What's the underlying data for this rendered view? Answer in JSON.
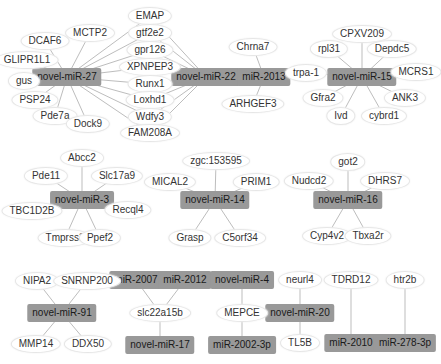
{
  "colors": {
    "mirna_fill": "#999999",
    "gene_fill": "#ffffff",
    "edge": "#bdbdbd",
    "text": "#333333"
  },
  "nodes": [
    {
      "id": "novel-miR-27",
      "type": "mirna",
      "x": 67,
      "y": 77
    },
    {
      "id": "novel-miR-22",
      "type": "mirna",
      "x": 206,
      "y": 77
    },
    {
      "id": "miR-2013",
      "type": "mirna",
      "x": 264,
      "y": 77
    },
    {
      "id": "novel-miR-15",
      "type": "mirna",
      "x": 362,
      "y": 77
    },
    {
      "id": "novel-miR-3",
      "type": "mirna",
      "x": 82,
      "y": 200
    },
    {
      "id": "novel-miR-14",
      "type": "mirna",
      "x": 215,
      "y": 200
    },
    {
      "id": "novel-miR-16",
      "type": "mirna",
      "x": 348,
      "y": 200
    },
    {
      "id": "novel-miR-91",
      "type": "mirna",
      "x": 62,
      "y": 313
    },
    {
      "id": "miR-2007",
      "type": "mirna",
      "x": 136,
      "y": 280
    },
    {
      "id": "miR-2012",
      "type": "mirna",
      "x": 185,
      "y": 280
    },
    {
      "id": "novel-miR-17",
      "type": "mirna",
      "x": 160,
      "y": 345
    },
    {
      "id": "novel-miR-4",
      "type": "mirna",
      "x": 242,
      "y": 280
    },
    {
      "id": "miR-2002-3p",
      "type": "mirna",
      "x": 242,
      "y": 345
    },
    {
      "id": "novel-miR-20",
      "type": "mirna",
      "x": 300,
      "y": 313
    },
    {
      "id": "miR-2010",
      "type": "mirna",
      "x": 351,
      "y": 343
    },
    {
      "id": "miR-278-3p",
      "type": "mirna",
      "x": 405,
      "y": 343
    },
    {
      "id": "EMAP",
      "type": "gene",
      "x": 150,
      "y": 16
    },
    {
      "id": "gtf2e2",
      "type": "gene",
      "x": 150,
      "y": 33
    },
    {
      "id": "gpr126",
      "type": "gene",
      "x": 150,
      "y": 50
    },
    {
      "id": "XPNPEP3",
      "type": "gene",
      "x": 150,
      "y": 67
    },
    {
      "id": "Runx1",
      "type": "gene",
      "x": 150,
      "y": 84
    },
    {
      "id": "Loxhd1",
      "type": "gene",
      "x": 150,
      "y": 100
    },
    {
      "id": "Wdfy3",
      "type": "gene",
      "x": 150,
      "y": 117
    },
    {
      "id": "FAM208A",
      "type": "gene",
      "x": 150,
      "y": 133
    },
    {
      "id": "MCTP2",
      "type": "gene",
      "x": 90,
      "y": 33
    },
    {
      "id": "DCAF6",
      "type": "gene",
      "x": 45,
      "y": 41
    },
    {
      "id": "GLIPR1L1",
      "type": "gene",
      "x": 27,
      "y": 60
    },
    {
      "id": "gus",
      "type": "gene",
      "x": 24,
      "y": 81
    },
    {
      "id": "PSP24",
      "type": "gene",
      "x": 35,
      "y": 100
    },
    {
      "id": "Pde7a",
      "type": "gene",
      "x": 55,
      "y": 116
    },
    {
      "id": "Dock9",
      "type": "gene",
      "x": 88,
      "y": 124
    },
    {
      "id": "Chrna7",
      "type": "gene",
      "x": 253,
      "y": 47
    },
    {
      "id": "ARHGEF3",
      "type": "gene",
      "x": 253,
      "y": 104
    },
    {
      "id": "CPXV209",
      "type": "gene",
      "x": 362,
      "y": 34
    },
    {
      "id": "rpl31",
      "type": "gene",
      "x": 329,
      "y": 49
    },
    {
      "id": "Depdc5",
      "type": "gene",
      "x": 392,
      "y": 49
    },
    {
      "id": "trpa-1",
      "type": "gene",
      "x": 306,
      "y": 73
    },
    {
      "id": "MCRS1",
      "type": "gene",
      "x": 416,
      "y": 72
    },
    {
      "id": "Gfra2",
      "type": "gene",
      "x": 323,
      "y": 98
    },
    {
      "id": "ANK3",
      "type": "gene",
      "x": 405,
      "y": 98
    },
    {
      "id": "Ivd",
      "type": "gene",
      "x": 341,
      "y": 116
    },
    {
      "id": "cybrd1",
      "type": "gene",
      "x": 384,
      "y": 116
    },
    {
      "id": "Abcc2",
      "type": "gene",
      "x": 82,
      "y": 158
    },
    {
      "id": "Pde11",
      "type": "gene",
      "x": 46,
      "y": 176
    },
    {
      "id": "Slc17a9",
      "type": "gene",
      "x": 117,
      "y": 176
    },
    {
      "id": "TBC1D2B",
      "type": "gene",
      "x": 32,
      "y": 211
    },
    {
      "id": "Recql4",
      "type": "gene",
      "x": 128,
      "y": 210
    },
    {
      "id": "Tmprss3",
      "type": "gene",
      "x": 65,
      "y": 238
    },
    {
      "id": "Ppef2",
      "type": "gene",
      "x": 100,
      "y": 238
    },
    {
      "id": "zgc:153595",
      "type": "gene",
      "x": 216,
      "y": 161
    },
    {
      "id": "MICAL2",
      "type": "gene",
      "x": 170,
      "y": 182
    },
    {
      "id": "PRIM1",
      "type": "gene",
      "x": 256,
      "y": 182
    },
    {
      "id": "Grasp",
      "type": "gene",
      "x": 190,
      "y": 238
    },
    {
      "id": "C5orf34",
      "type": "gene",
      "x": 240,
      "y": 238
    },
    {
      "id": "got2",
      "type": "gene",
      "x": 348,
      "y": 162
    },
    {
      "id": "Nudcd2",
      "type": "gene",
      "x": 309,
      "y": 181
    },
    {
      "id": "DHRS7",
      "type": "gene",
      "x": 385,
      "y": 181
    },
    {
      "id": "Cyp4v2",
      "type": "gene",
      "x": 327,
      "y": 236
    },
    {
      "id": "Tbxa2r",
      "type": "gene",
      "x": 368,
      "y": 236
    },
    {
      "id": "NIPA2",
      "type": "gene",
      "x": 37,
      "y": 281
    },
    {
      "id": "SNRNP200",
      "type": "gene",
      "x": 87,
      "y": 281
    },
    {
      "id": "MMP14",
      "type": "gene",
      "x": 36,
      "y": 344
    },
    {
      "id": "DDX50",
      "type": "gene",
      "x": 88,
      "y": 344
    },
    {
      "id": "slc22a15b",
      "type": "gene",
      "x": 160,
      "y": 313
    },
    {
      "id": "MEPCE",
      "type": "gene",
      "x": 242,
      "y": 313
    },
    {
      "id": "neurl4",
      "type": "gene",
      "x": 300,
      "y": 280
    },
    {
      "id": "TL5B",
      "type": "gene",
      "x": 300,
      "y": 343
    },
    {
      "id": "TDRD12",
      "type": "gene",
      "x": 351,
      "y": 280
    },
    {
      "id": "htr2b",
      "type": "gene",
      "x": 405,
      "y": 280
    }
  ],
  "edges": [
    [
      "novel-miR-27",
      "EMAP"
    ],
    [
      "novel-miR-27",
      "gtf2e2"
    ],
    [
      "novel-miR-27",
      "gpr126"
    ],
    [
      "novel-miR-27",
      "XPNPEP3"
    ],
    [
      "novel-miR-27",
      "Runx1"
    ],
    [
      "novel-miR-27",
      "Loxhd1"
    ],
    [
      "novel-miR-27",
      "Wdfy3"
    ],
    [
      "novel-miR-27",
      "FAM208A"
    ],
    [
      "novel-miR-27",
      "MCTP2"
    ],
    [
      "novel-miR-27",
      "DCAF6"
    ],
    [
      "novel-miR-27",
      "GLIPR1L1"
    ],
    [
      "novel-miR-27",
      "gus"
    ],
    [
      "novel-miR-27",
      "PSP24"
    ],
    [
      "novel-miR-27",
      "Pde7a"
    ],
    [
      "novel-miR-27",
      "Dock9"
    ],
    [
      "novel-miR-22",
      "EMAP"
    ],
    [
      "novel-miR-22",
      "gtf2e2"
    ],
    [
      "novel-miR-22",
      "gpr126"
    ],
    [
      "novel-miR-22",
      "XPNPEP3"
    ],
    [
      "novel-miR-22",
      "Runx1"
    ],
    [
      "novel-miR-22",
      "Loxhd1"
    ],
    [
      "novel-miR-22",
      "Wdfy3"
    ],
    [
      "novel-miR-22",
      "FAM208A"
    ],
    [
      "miR-2013",
      "Chrna7"
    ],
    [
      "miR-2013",
      "ARHGEF3"
    ],
    [
      "novel-miR-15",
      "CPXV209"
    ],
    [
      "novel-miR-15",
      "rpl31"
    ],
    [
      "novel-miR-15",
      "Depdc5"
    ],
    [
      "novel-miR-15",
      "trpa-1"
    ],
    [
      "novel-miR-15",
      "MCRS1"
    ],
    [
      "novel-miR-15",
      "Gfra2"
    ],
    [
      "novel-miR-15",
      "ANK3"
    ],
    [
      "novel-miR-15",
      "Ivd"
    ],
    [
      "novel-miR-15",
      "cybrd1"
    ],
    [
      "novel-miR-3",
      "Abcc2"
    ],
    [
      "novel-miR-3",
      "Pde11"
    ],
    [
      "novel-miR-3",
      "Slc17a9"
    ],
    [
      "novel-miR-3",
      "TBC1D2B"
    ],
    [
      "novel-miR-3",
      "Recql4"
    ],
    [
      "novel-miR-3",
      "Tmprss3"
    ],
    [
      "novel-miR-3",
      "Ppef2"
    ],
    [
      "novel-miR-14",
      "zgc:153595"
    ],
    [
      "novel-miR-14",
      "MICAL2"
    ],
    [
      "novel-miR-14",
      "PRIM1"
    ],
    [
      "novel-miR-14",
      "Grasp"
    ],
    [
      "novel-miR-14",
      "C5orf34"
    ],
    [
      "novel-miR-16",
      "got2"
    ],
    [
      "novel-miR-16",
      "Nudcd2"
    ],
    [
      "novel-miR-16",
      "DHRS7"
    ],
    [
      "novel-miR-16",
      "Cyp4v2"
    ],
    [
      "novel-miR-16",
      "Tbxa2r"
    ],
    [
      "novel-miR-91",
      "NIPA2"
    ],
    [
      "novel-miR-91",
      "SNRNP200"
    ],
    [
      "novel-miR-91",
      "MMP14"
    ],
    [
      "novel-miR-91",
      "DDX50"
    ],
    [
      "miR-2007",
      "slc22a15b"
    ],
    [
      "miR-2012",
      "slc22a15b"
    ],
    [
      "novel-miR-17",
      "slc22a15b"
    ],
    [
      "novel-miR-4",
      "MEPCE"
    ],
    [
      "miR-2002-3p",
      "MEPCE"
    ],
    [
      "novel-miR-20",
      "neurl4"
    ],
    [
      "novel-miR-20",
      "TL5B"
    ],
    [
      "miR-2010",
      "TDRD12"
    ],
    [
      "miR-278-3p",
      "htr2b"
    ]
  ]
}
